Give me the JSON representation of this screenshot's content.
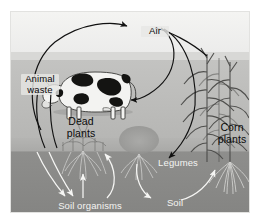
{
  "diagram": {
    "type": "illustration",
    "labels": {
      "air": "Air",
      "animal_waste": "Animal\nwaste",
      "dead_plants": "Dead\nplants",
      "soil_organisms": "Soil organisms",
      "legumes": "Legumes",
      "soil": "Soil",
      "corn_plants": "Corn\nplants"
    },
    "bands": [
      {
        "name": "sky",
        "color": "#f2f2f0"
      },
      {
        "name": "field",
        "color": "#bdbdbb"
      },
      {
        "name": "soil",
        "color": "#8a8a88"
      }
    ],
    "elements": [
      {
        "name": "cow",
        "label": "dairy cow"
      },
      {
        "name": "corn-plants",
        "label": "corn plants"
      },
      {
        "name": "legume-plant",
        "label": "legume plant"
      },
      {
        "name": "plant-roots",
        "label": "root systems"
      }
    ],
    "arrows": [
      {
        "name": "animal-waste-to-air",
        "color": "#111111",
        "from": "Animal waste",
        "to": "Air"
      },
      {
        "name": "corn-to-air",
        "color": "#111111",
        "from": "Corn plants",
        "to": "Air"
      },
      {
        "name": "air-to-cow",
        "color": "#111111",
        "from": "Air",
        "to": "cow"
      },
      {
        "name": "air-to-legumes",
        "color": "#111111",
        "from": "Air",
        "to": "Legumes"
      },
      {
        "name": "animal-waste-to-soil-organisms",
        "color": "#111111",
        "from": "Animal waste",
        "to": "Soil organisms"
      },
      {
        "name": "dead-plants-to-soil-organisms",
        "color": "#111111",
        "from": "Dead plants",
        "to": "Soil organisms"
      },
      {
        "name": "soil-organisms-to-roots",
        "color": "#f6f6f4",
        "from": "Soil organisms",
        "to": "roots"
      },
      {
        "name": "legumes-to-soil",
        "color": "#f6f6f4",
        "from": "Legumes",
        "to": "Soil"
      },
      {
        "name": "soil-to-corn-roots",
        "color": "#f6f6f4",
        "from": "Soil",
        "to": "corn roots"
      }
    ]
  }
}
